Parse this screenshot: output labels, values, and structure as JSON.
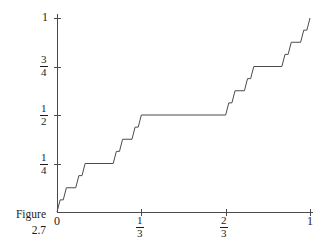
{
  "figure": {
    "caption_line1": "Figure",
    "caption_line2": "2.7"
  },
  "axes": {
    "y_ticks": [
      {
        "label_num": "1",
        "label_den": "",
        "is_fraction": false,
        "value": 1
      },
      {
        "label_num": "3",
        "label_den": "4",
        "is_fraction": true,
        "value": 0.75
      },
      {
        "label_num": "1",
        "label_den": "2",
        "is_fraction": true,
        "value": 0.5
      },
      {
        "label_num": "1",
        "label_den": "4",
        "is_fraction": true,
        "value": 0.25
      }
    ],
    "x_ticks": [
      {
        "label_num": "0",
        "label_den": "",
        "is_fraction": false,
        "value": 0
      },
      {
        "label_num": "1",
        "label_den": "3",
        "is_fraction": true,
        "value": 0.3333
      },
      {
        "label_num": "2",
        "label_den": "3",
        "is_fraction": true,
        "value": 0.6667
      },
      {
        "label_num": "1",
        "label_den": "",
        "is_fraction": false,
        "value": 1
      }
    ],
    "xlim": [
      0,
      1
    ],
    "ylim": [
      0,
      1
    ],
    "axis_color": "#4a4a4a"
  },
  "chart_data": {
    "type": "line",
    "title": "",
    "subtitle": "",
    "xlabel": "",
    "ylabel": "",
    "xlim": [
      0,
      1
    ],
    "ylim": [
      0,
      1
    ],
    "grid": false,
    "legend": null,
    "annotations": [],
    "curve_color": "#4b4b4b",
    "xticks": [
      0,
      0.3333333,
      0.6666667,
      1
    ],
    "xticklabels": [
      "0",
      "1/3",
      "2/3",
      "1"
    ],
    "yticks": [
      0.25,
      0.5,
      0.75,
      1
    ],
    "yticklabels": [
      "1/4",
      "1/2",
      "3/4",
      "1"
    ],
    "series": [
      {
        "name": "Cantor function",
        "points": [
          [
            0.0,
            0.0
          ],
          [
            0.012345679,
            0.0625
          ],
          [
            0.024691358,
            0.0625
          ],
          [
            0.037037037,
            0.125
          ],
          [
            0.074074074,
            0.125
          ],
          [
            0.086419753,
            0.1875
          ],
          [
            0.098765432,
            0.1875
          ],
          [
            0.111111111,
            0.25
          ],
          [
            0.222222222,
            0.25
          ],
          [
            0.234567901,
            0.3125
          ],
          [
            0.24691358,
            0.3125
          ],
          [
            0.259259259,
            0.375
          ],
          [
            0.296296296,
            0.375
          ],
          [
            0.308641975,
            0.4375
          ],
          [
            0.320987654,
            0.4375
          ],
          [
            0.333333333,
            0.5
          ],
          [
            0.666666667,
            0.5
          ],
          [
            0.679012346,
            0.5625
          ],
          [
            0.691358025,
            0.5625
          ],
          [
            0.703703704,
            0.625
          ],
          [
            0.740740741,
            0.625
          ],
          [
            0.75308642,
            0.6875
          ],
          [
            0.765432099,
            0.6875
          ],
          [
            0.777777778,
            0.75
          ],
          [
            0.888888889,
            0.75
          ],
          [
            0.901234568,
            0.8125
          ],
          [
            0.913580247,
            0.8125
          ],
          [
            0.925925926,
            0.875
          ],
          [
            0.962962963,
            0.875
          ],
          [
            0.975308642,
            0.9375
          ],
          [
            0.987654321,
            0.9375
          ],
          [
            1.0,
            1.0
          ]
        ]
      }
    ]
  },
  "plot_geometry": {
    "origin_x": 57,
    "origin_y": 212,
    "right_x": 310,
    "top_y": 18
  }
}
